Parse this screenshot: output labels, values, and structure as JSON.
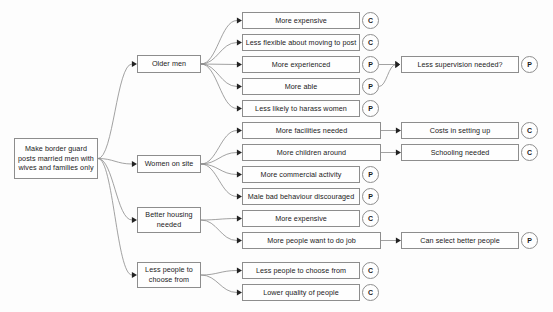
{
  "diagram": {
    "title": "Make border guard posts married men with wives and families only",
    "type": "consequence-tree",
    "legend": {
      "C": "C",
      "P": "P"
    },
    "colors": {
      "background": "#fdfdfd",
      "node_fill": "#fefefe",
      "node_border": "#8d8d8d",
      "edge": "#8a8a8a",
      "text": "#1a1a1a"
    },
    "nodes": [
      {
        "id": "root",
        "label": "Make border guard posts married men with wives and families only",
        "badge": null,
        "x": 14,
        "y": 138,
        "w": 84,
        "h": 41
      },
      {
        "id": "b1",
        "label": "Older men",
        "badge": null,
        "x": 137,
        "y": 55,
        "w": 64,
        "h": 18
      },
      {
        "id": "b2",
        "label": "Women on site",
        "badge": null,
        "x": 137,
        "y": 155,
        "w": 64,
        "h": 18
      },
      {
        "id": "b3",
        "label": "Better housing needed",
        "badge": null,
        "x": 137,
        "y": 207,
        "w": 64,
        "h": 26
      },
      {
        "id": "b4",
        "label": "Less people to choose from",
        "badge": null,
        "x": 137,
        "y": 262,
        "w": 64,
        "h": 26
      },
      {
        "id": "c1",
        "label": "More expensive",
        "badge": "C",
        "x": 242,
        "y": 12,
        "w": 118,
        "h": 17
      },
      {
        "id": "c2",
        "label": "Less flexible about moving to post",
        "badge": "C",
        "x": 242,
        "y": 34,
        "w": 118,
        "h": 17
      },
      {
        "id": "c3",
        "label": "More experienced",
        "badge": "P",
        "x": 242,
        "y": 56,
        "w": 118,
        "h": 17
      },
      {
        "id": "c4",
        "label": "More able",
        "badge": "P",
        "x": 242,
        "y": 78,
        "w": 118,
        "h": 17
      },
      {
        "id": "c5",
        "label": "Less likely to harass women",
        "badge": "P",
        "x": 242,
        "y": 100,
        "w": 118,
        "h": 17
      },
      {
        "id": "c6",
        "label": "More facilities needed",
        "badge": null,
        "x": 242,
        "y": 122,
        "w": 139,
        "h": 17
      },
      {
        "id": "c7",
        "label": "More children around",
        "badge": null,
        "x": 242,
        "y": 144,
        "w": 139,
        "h": 17
      },
      {
        "id": "c8",
        "label": "More commercial activity",
        "badge": "P",
        "x": 242,
        "y": 166,
        "w": 118,
        "h": 17
      },
      {
        "id": "c9",
        "label": "Male bad behaviour discouraged",
        "badge": "P",
        "x": 242,
        "y": 188,
        "w": 118,
        "h": 17
      },
      {
        "id": "c10",
        "label": "More expensive",
        "badge": "C",
        "x": 242,
        "y": 210,
        "w": 118,
        "h": 17
      },
      {
        "id": "c11",
        "label": "More people want to do job",
        "badge": null,
        "x": 242,
        "y": 232,
        "w": 139,
        "h": 17
      },
      {
        "id": "c12",
        "label": "Less people to choose from",
        "badge": "C",
        "x": 242,
        "y": 262,
        "w": 118,
        "h": 17
      },
      {
        "id": "c13",
        "label": "Lower quality of people",
        "badge": "C",
        "x": 242,
        "y": 284,
        "w": 118,
        "h": 17
      },
      {
        "id": "d1",
        "label": "Less supervision needed?",
        "badge": "P",
        "x": 401,
        "y": 56,
        "w": 118,
        "h": 17
      },
      {
        "id": "d2",
        "label": "Costs in setting up",
        "badge": "C",
        "x": 401,
        "y": 122,
        "w": 118,
        "h": 17
      },
      {
        "id": "d3",
        "label": "Schooling needed",
        "badge": "C",
        "x": 401,
        "y": 144,
        "w": 118,
        "h": 17
      },
      {
        "id": "d4",
        "label": "Can select better people",
        "badge": "P",
        "x": 401,
        "y": 232,
        "w": 118,
        "h": 17
      }
    ],
    "edges": [
      {
        "from": "root",
        "to": "b1"
      },
      {
        "from": "root",
        "to": "b2"
      },
      {
        "from": "root",
        "to": "b3"
      },
      {
        "from": "root",
        "to": "b4"
      },
      {
        "from": "b1",
        "to": "c1"
      },
      {
        "from": "b1",
        "to": "c2"
      },
      {
        "from": "b1",
        "to": "c3"
      },
      {
        "from": "b1",
        "to": "c4"
      },
      {
        "from": "b1",
        "to": "c5"
      },
      {
        "from": "b2",
        "to": "c6"
      },
      {
        "from": "b2",
        "to": "c7"
      },
      {
        "from": "b2",
        "to": "c8"
      },
      {
        "from": "b2",
        "to": "c9"
      },
      {
        "from": "b3",
        "to": "c10"
      },
      {
        "from": "b3",
        "to": "c11"
      },
      {
        "from": "b4",
        "to": "c12"
      },
      {
        "from": "b4",
        "to": "c13"
      },
      {
        "from": "c3",
        "to": "d1"
      },
      {
        "from": "c4",
        "to": "d1"
      },
      {
        "from": "c6",
        "to": "d2"
      },
      {
        "from": "c7",
        "to": "d3"
      },
      {
        "from": "c11",
        "to": "d4"
      }
    ]
  }
}
